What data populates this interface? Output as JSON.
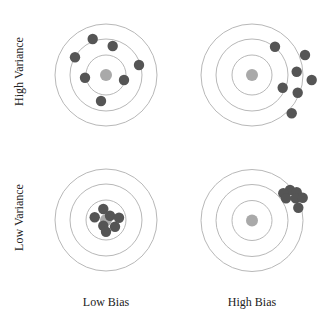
{
  "row_labels": [
    "High Variance",
    "Low Variance"
  ],
  "col_labels": [
    "Low Bias",
    "High Bias"
  ],
  "colors": {
    "ring": "#b8b8b8",
    "bullseye": "#a9a9a9",
    "hit": "#555555",
    "text": "#222222"
  },
  "ring_radii": [
    51,
    36,
    20
  ],
  "bullseye_radius": 6,
  "hit_radius": 5.2,
  "targets": [
    {
      "name": "low-bias-high-variance",
      "row": "High Variance",
      "col": "Low Bias",
      "center": [
        106,
        75
      ],
      "hits": [
        [
          92.7,
          39
        ],
        [
          112.7,
          46
        ],
        [
          75,
          57.3
        ],
        [
          139,
          65
        ],
        [
          85,
          77.7
        ],
        [
          124,
          80
        ],
        [
          101,
          101
        ]
      ]
    },
    {
      "name": "high-bias-high-variance",
      "row": "High Variance",
      "col": "High Bias",
      "center": [
        252,
        75
      ],
      "hits": [
        [
          275,
          46.7
        ],
        [
          305,
          55
        ],
        [
          296.7,
          71.7
        ],
        [
          311.7,
          80
        ],
        [
          282.7,
          87.7
        ],
        [
          297.7,
          92.7
        ],
        [
          291.7,
          113.3
        ]
      ]
    },
    {
      "name": "low-bias-low-variance",
      "row": "Low Variance",
      "col": "Low Bias",
      "center": [
        106,
        220
      ],
      "hits": [
        [
          103.3,
          209
        ],
        [
          94.7,
          217.3
        ],
        [
          110,
          215.7
        ],
        [
          119,
          217.7
        ],
        [
          103.3,
          225.7
        ],
        [
          115,
          226.7
        ],
        [
          106,
          231.7
        ]
      ]
    },
    {
      "name": "high-bias-low-variance",
      "row": "Low Variance",
      "col": "High Bias",
      "center": [
        252,
        220.5
      ],
      "hits": [
        [
          290,
          190
        ],
        [
          296.7,
          192.3
        ],
        [
          283.3,
          193.3
        ],
        [
          286,
          198.3
        ],
        [
          295.7,
          198.3
        ],
        [
          302.7,
          197.7
        ],
        [
          298.3,
          207.7
        ]
      ]
    }
  ]
}
